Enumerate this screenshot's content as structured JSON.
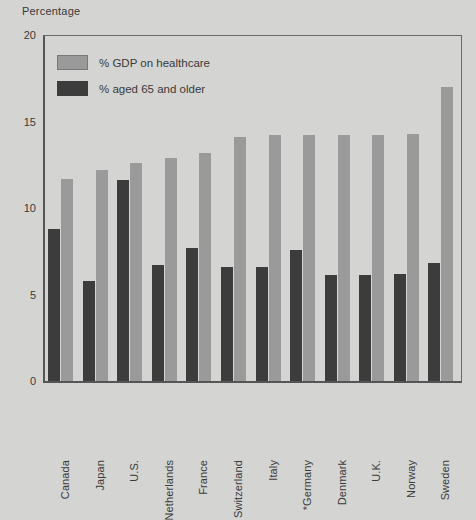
{
  "chart_data": {
    "type": "bar",
    "title": "",
    "ylabel": "Percentage",
    "xlabel": "",
    "ylim": [
      0,
      20
    ],
    "yticks": [
      0,
      5,
      10,
      15,
      20
    ],
    "grid": false,
    "legend_position": "top-left",
    "categories": [
      "Canada",
      "Japan",
      "U.S.",
      "Netherlands",
      "France",
      "Switzerland",
      "Italy",
      "*Germany",
      "Denmark",
      "U.K.",
      "Norway",
      "Sweden"
    ],
    "series": [
      {
        "name": "% aged 65 and older",
        "color": "#3c3c3c",
        "values": [
          8.8,
          5.8,
          11.6,
          6.7,
          7.7,
          6.6,
          6.6,
          7.6,
          6.1,
          6.1,
          6.2,
          6.8
        ]
      },
      {
        "name": "% GDP on healthcare",
        "color": "#9a9a9a",
        "values": [
          11.7,
          12.2,
          12.6,
          12.9,
          13.2,
          14.1,
          14.2,
          14.2,
          14.2,
          14.2,
          14.3,
          17.0
        ]
      }
    ],
    "annotations": []
  },
  "legend": {
    "items": [
      {
        "label": "% GDP on healthcare",
        "swatch": "light"
      },
      {
        "label": "% aged 65 and older",
        "swatch": "dark"
      }
    ]
  },
  "axis": {
    "y_title": "Percentage"
  }
}
